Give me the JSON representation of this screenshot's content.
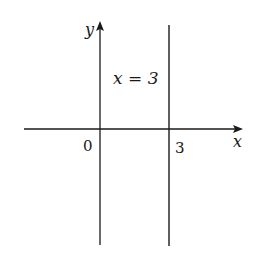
{
  "diagram": {
    "axes": {
      "x_label": "x",
      "y_label": "y",
      "origin_label": "0",
      "tick_label": "3"
    },
    "line_label": "x = 3",
    "colors": {
      "stroke": "#1a1a1a",
      "background": "#ffffff"
    }
  }
}
